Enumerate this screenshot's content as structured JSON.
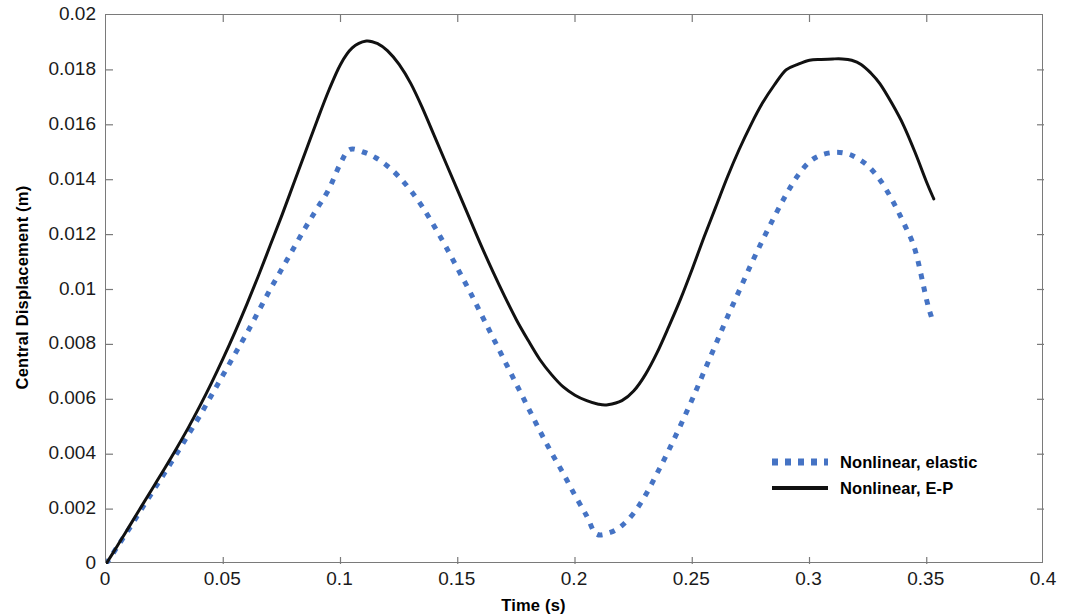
{
  "chart_data": {
    "type": "line",
    "title": "",
    "xlabel": "Time (s)",
    "ylabel": "Central Displacement (m)",
    "xlim": [
      0,
      0.4
    ],
    "ylim": [
      0,
      0.02
    ],
    "xticks": [
      "0",
      "0.05",
      "0.1",
      "0.15",
      "0.2",
      "0.25",
      "0.3",
      "0.35",
      "0.4"
    ],
    "xtick_values": [
      0,
      0.05,
      0.1,
      0.15,
      0.2,
      0.25,
      0.3,
      0.35,
      0.4
    ],
    "yticks": [
      "0",
      "0.002",
      "0.004",
      "0.006",
      "0.008",
      "0.01",
      "0.012",
      "0.014",
      "0.016",
      "0.018",
      "0.02"
    ],
    "ytick_values": [
      0,
      0.002,
      0.004,
      0.006,
      0.008,
      0.01,
      0.012,
      0.014,
      0.016,
      0.018,
      0.02
    ],
    "grid": false,
    "legend_position": "lower-right-inside",
    "series": [
      {
        "name": "Nonlinear, elastic",
        "style": "dotted",
        "color": "#4573C4",
        "linewidth": 5,
        "x": [
          0.0,
          0.005,
          0.01,
          0.015,
          0.02,
          0.025,
          0.03,
          0.035,
          0.04,
          0.045,
          0.05,
          0.055,
          0.06,
          0.065,
          0.07,
          0.075,
          0.08,
          0.085,
          0.09,
          0.095,
          0.1,
          0.104,
          0.11,
          0.115,
          0.12,
          0.125,
          0.13,
          0.135,
          0.14,
          0.145,
          0.15,
          0.155,
          0.16,
          0.165,
          0.17,
          0.175,
          0.18,
          0.185,
          0.19,
          0.195,
          0.2,
          0.205,
          0.209,
          0.215,
          0.22,
          0.225,
          0.23,
          0.235,
          0.24,
          0.245,
          0.25,
          0.255,
          0.26,
          0.265,
          0.27,
          0.275,
          0.28,
          0.285,
          0.29,
          0.295,
          0.3,
          0.305,
          0.311,
          0.316,
          0.32,
          0.325,
          0.33,
          0.335,
          0.34,
          0.345,
          0.35,
          0.352
        ],
        "y": [
          0.0,
          0.00065,
          0.0013,
          0.00198,
          0.00265,
          0.00332,
          0.004,
          0.0047,
          0.0054,
          0.00615,
          0.0069,
          0.00765,
          0.0084,
          0.0092,
          0.01,
          0.01075,
          0.0115,
          0.01225,
          0.01295,
          0.01365,
          0.0146,
          0.0151,
          0.015,
          0.0148,
          0.0145,
          0.0141,
          0.0136,
          0.013,
          0.0123,
          0.01155,
          0.01075,
          0.00995,
          0.0091,
          0.00825,
          0.0074,
          0.00655,
          0.0057,
          0.00485,
          0.00405,
          0.0033,
          0.0025,
          0.00175,
          0.0011,
          0.00115,
          0.0014,
          0.00185,
          0.0025,
          0.0033,
          0.00415,
          0.00505,
          0.006,
          0.007,
          0.008,
          0.009,
          0.00995,
          0.0109,
          0.0118,
          0.01265,
          0.01345,
          0.01415,
          0.01465,
          0.0149,
          0.015,
          0.01495,
          0.0148,
          0.0145,
          0.014,
          0.0133,
          0.01245,
          0.01145,
          0.0096,
          0.009
        ]
      },
      {
        "name": "Nonlinear, E-P",
        "style": "solid",
        "color": "#111111",
        "linewidth": 3,
        "x": [
          0.0,
          0.005,
          0.01,
          0.015,
          0.02,
          0.025,
          0.03,
          0.035,
          0.04,
          0.045,
          0.05,
          0.055,
          0.06,
          0.065,
          0.07,
          0.075,
          0.08,
          0.085,
          0.09,
          0.095,
          0.1,
          0.105,
          0.111,
          0.116,
          0.12,
          0.125,
          0.13,
          0.135,
          0.14,
          0.145,
          0.15,
          0.155,
          0.16,
          0.165,
          0.17,
          0.175,
          0.18,
          0.185,
          0.19,
          0.195,
          0.2,
          0.205,
          0.21,
          0.214,
          0.22,
          0.225,
          0.23,
          0.235,
          0.24,
          0.245,
          0.25,
          0.255,
          0.26,
          0.265,
          0.27,
          0.275,
          0.28,
          0.285,
          0.29,
          0.295,
          0.3,
          0.305,
          0.31,
          0.314,
          0.318,
          0.322,
          0.326,
          0.33,
          0.335,
          0.34,
          0.345,
          0.35,
          0.353
        ],
        "y": [
          0.0,
          0.00068,
          0.00138,
          0.00208,
          0.00278,
          0.00348,
          0.0042,
          0.00495,
          0.00575,
          0.0066,
          0.0075,
          0.00845,
          0.00945,
          0.0105,
          0.0116,
          0.0127,
          0.01385,
          0.015,
          0.01615,
          0.01725,
          0.0182,
          0.0188,
          0.01905,
          0.01895,
          0.0187,
          0.0182,
          0.0175,
          0.0166,
          0.0156,
          0.0146,
          0.0136,
          0.0126,
          0.0116,
          0.01065,
          0.00975,
          0.0089,
          0.00815,
          0.00745,
          0.0069,
          0.00645,
          0.00615,
          0.00595,
          0.00582,
          0.0058,
          0.00595,
          0.0063,
          0.0069,
          0.0077,
          0.00865,
          0.00965,
          0.01075,
          0.0119,
          0.013,
          0.0141,
          0.0151,
          0.016,
          0.0168,
          0.01745,
          0.018,
          0.0182,
          0.01835,
          0.01838,
          0.0184,
          0.0184,
          0.01835,
          0.0182,
          0.0179,
          0.0175,
          0.0168,
          0.016,
          0.015,
          0.0139,
          0.0133
        ]
      }
    ],
    "annotations": {
      "elastic_peak1": 0.0151,
      "elastic_trough": 0.0011,
      "elastic_peak2": 0.015,
      "ep_peak1": 0.019,
      "ep_trough": 0.0058,
      "ep_peak2": 0.0184
    }
  },
  "legend": {
    "items": [
      {
        "label": "Nonlinear, elastic",
        "color": "#4573C4",
        "style": "dotted"
      },
      {
        "label": "Nonlinear, E-P",
        "color": "#111111",
        "style": "solid"
      }
    ]
  },
  "colors": {
    "elastic": "#4573C4",
    "ep": "#111111",
    "axis": "#7a7a7a",
    "text": "#000000",
    "background": "#ffffff"
  }
}
